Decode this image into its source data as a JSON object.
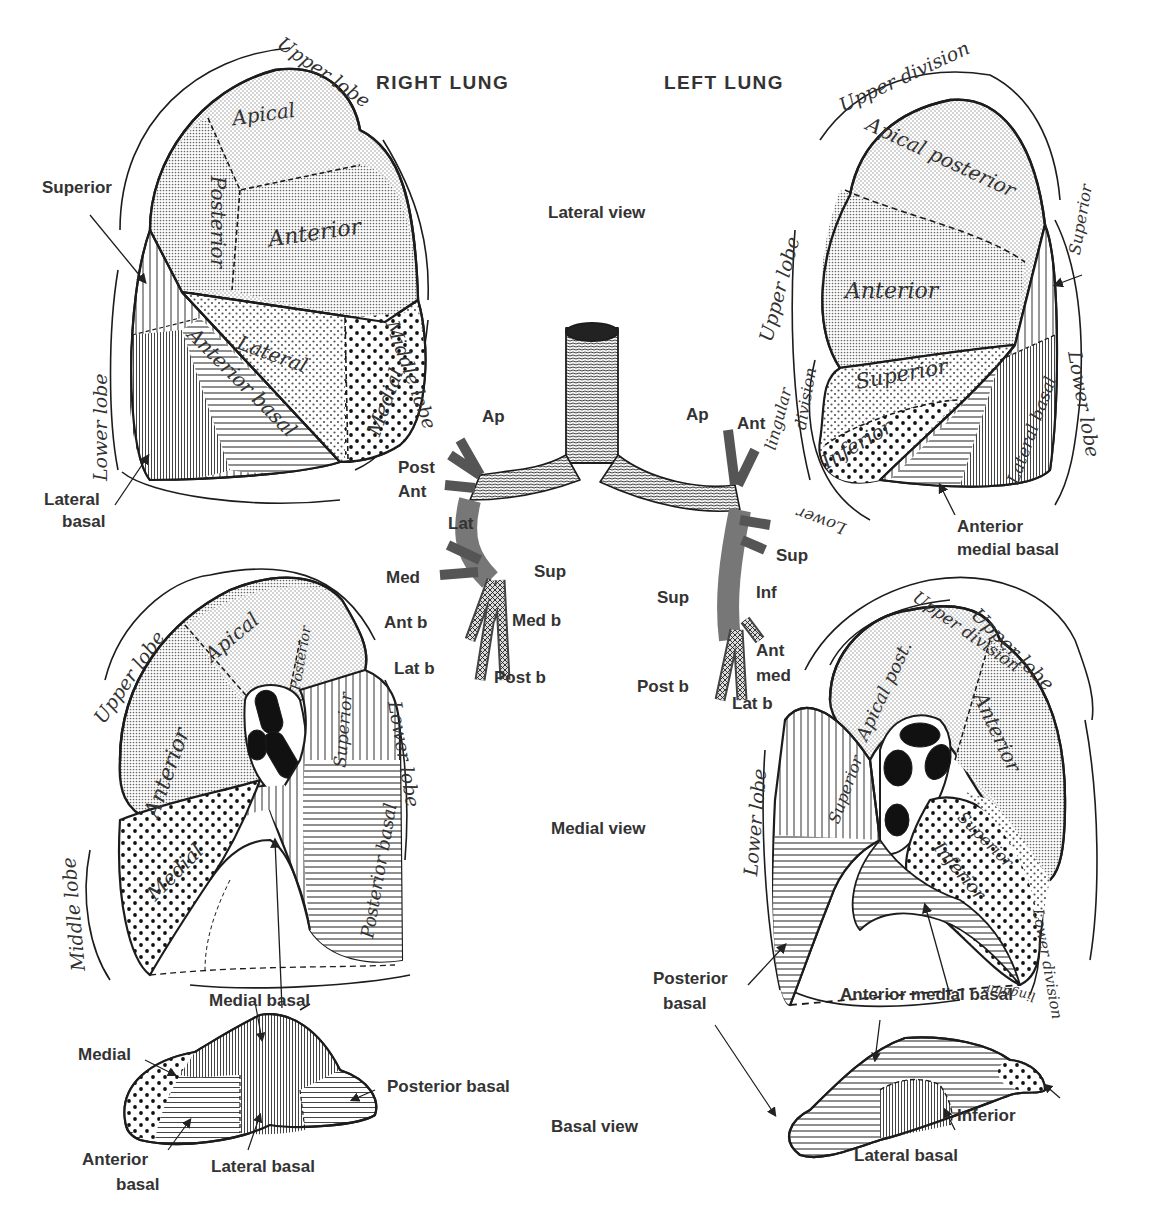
{
  "header": {
    "right_lung_title": "RIGHT LUNG",
    "left_lung_title": "LEFT LUNG"
  },
  "views": {
    "lateral": "Lateral view",
    "medial": "Medial view",
    "basal": "Basal view"
  },
  "right_lateral": {
    "lobes": {
      "upper": "Upper lobe",
      "middle": "Middle lobe",
      "lower": "Lower lobe"
    },
    "segments": {
      "apical": "Apical",
      "posterior": "Posterior",
      "anterior": "Anterior",
      "lateral": "Lateral",
      "medial": "Medial",
      "anterior_basal": "Anterior basal"
    },
    "callouts": {
      "superior": "Superior",
      "lateral_basal_1": "Lateral",
      "lateral_basal_2": "basal"
    }
  },
  "left_lateral": {
    "lobes": {
      "upper_division": "Upper division",
      "upper_lobe": "Upper lobe",
      "lower_lobe": "Lower lobe",
      "lingular_1": "lingular",
      "lingular_2": "division",
      "lower_lingular": "Lower"
    },
    "segments": {
      "apical_posterior": "Apical posterior",
      "anterior": "Anterior",
      "superior_upper": "Superior",
      "inferior": "Inferior",
      "superior_lower": "Superior",
      "lateral_basal": "Lateral basal"
    },
    "callouts": {
      "anterior_medial_basal_1": "Anterior",
      "anterior_medial_basal_2": "medial basal"
    }
  },
  "bronchi": {
    "right": {
      "ap": "Ap",
      "post": "Post",
      "ant": "Ant",
      "lat": "Lat",
      "med": "Med",
      "sup": "Sup",
      "ant_b": "Ant b",
      "med_b": "Med b",
      "lat_b": "Lat b",
      "post_b": "Post b"
    },
    "left": {
      "ap": "Ap",
      "ant": "Ant",
      "sup_lingular": "Sup",
      "inf": "Inf",
      "sup": "Sup",
      "ant_med_1": "Ant",
      "ant_med_2": "med",
      "post_b": "Post b",
      "lat_b": "Lat b"
    }
  },
  "right_medial": {
    "lobes": {
      "upper": "Upper lobe",
      "lower": "Lower lobe",
      "middle": "Middle lobe"
    },
    "segments": {
      "apical": "Apical",
      "posterior": "Posterior",
      "anterior": "Anterior",
      "superior": "Superior",
      "medial": "Medial",
      "posterior_basal": "Posterior basal"
    },
    "callouts": {
      "medial_basal": "Medial basal"
    }
  },
  "left_medial": {
    "lobes": {
      "upper_lobe": "Upper lobe",
      "upper_division": "Upper division",
      "lower_lobe": "Lower lobe",
      "lower_division": "Lower division",
      "lingular": "lingular"
    },
    "segments": {
      "apical_post": "Apical post.",
      "anterior": "Anterior",
      "superior_lower": "Superior",
      "superior_lingula": "Superior",
      "inferior": "Inferior"
    },
    "callouts": {
      "posterior_basal_1": "Posterior",
      "posterior_basal_2": "basal",
      "anterior_medial_basal": "Anterior medial basal"
    }
  },
  "right_basal": {
    "callouts": {
      "medial_basal": "Medial basal",
      "medial": "Medial",
      "posterior_basal": "Posterior basal",
      "anterior_basal_1": "Anterior",
      "anterior_basal_2": "basal",
      "lateral_basal": "Lateral basal"
    }
  },
  "left_basal": {
    "callouts": {
      "inferior": "Inferior",
      "lateral_basal": "Lateral basal"
    }
  },
  "patterns": {
    "fine_stipple": "#9a9a9a",
    "medium_stipple": "#6a6a6a",
    "coarse_dots": "#222222",
    "vertical_lines": "#333333",
    "horizontal_lines": "#333333",
    "outline": "#1c1c1c"
  }
}
